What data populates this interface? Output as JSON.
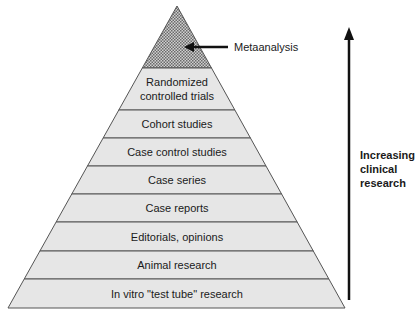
{
  "colors": {
    "layer_fill": "#e6e6e6",
    "stroke": "#555555",
    "hatch_fill": "#8a8a8a",
    "text": "#1a1a1a",
    "arrow": "#111111"
  },
  "pyramid": {
    "apex": "Metaanalysis",
    "apex_callout": "Metaanalysis",
    "layers": [
      {
        "lines": [
          "Randomized",
          "controlled trials"
        ]
      },
      {
        "lines": [
          "Cohort studies"
        ]
      },
      {
        "lines": [
          "Case control studies"
        ]
      },
      {
        "lines": [
          "Case series"
        ]
      },
      {
        "lines": [
          "Case reports"
        ]
      },
      {
        "lines": [
          "Editorials, opinions"
        ]
      },
      {
        "lines": [
          "Animal research"
        ]
      },
      {
        "lines": [
          "In vitro \"test tube\" research"
        ]
      }
    ]
  },
  "side_arrow": {
    "label_lines": [
      "Increasing",
      "clinical",
      "research"
    ]
  }
}
